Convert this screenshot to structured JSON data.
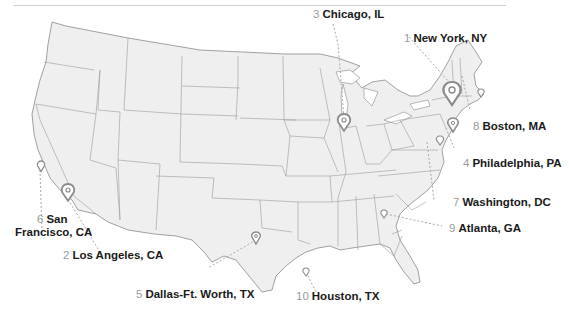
{
  "map": {
    "region": "Contiguous United States",
    "land_fill": "#efefef",
    "border_color": "#8a8a8a",
    "marker_color": "#8c8c8c",
    "leader_color": "#a8a8a8",
    "rank_color": "#9a9a9a",
    "label_color": "#1a1a1a"
  },
  "cities": [
    {
      "rank": "1",
      "name": "New York, NY"
    },
    {
      "rank": "2",
      "name": "Los Angeles, CA"
    },
    {
      "rank": "3",
      "name": "Chicago, IL"
    },
    {
      "rank": "4",
      "name": "Philadelphia, PA"
    },
    {
      "rank": "5",
      "name": "Dallas-Ft. Worth, TX"
    },
    {
      "rank": "6",
      "name": "San Francisco, CA",
      "line1": "San",
      "line2": "Francisco, CA"
    },
    {
      "rank": "7",
      "name": "Washington, DC"
    },
    {
      "rank": "8",
      "name": "Boston, MA"
    },
    {
      "rank": "9",
      "name": "Atlanta, GA"
    },
    {
      "rank": "10",
      "name": "Houston, TX"
    }
  ]
}
